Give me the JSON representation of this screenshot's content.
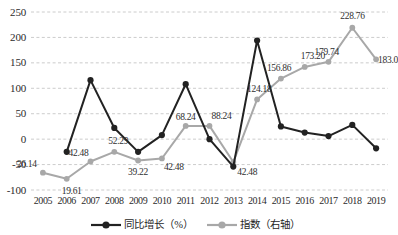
{
  "chart_data": {
    "type": "line",
    "title": "",
    "subtitle": "",
    "xlabel": "",
    "ylabel": "",
    "ylim": [
      -100,
      250
    ],
    "ytick_step": 50,
    "grid": true,
    "grid_style": "dashed",
    "legend_position": "bottom",
    "x": [
      "2005",
      "2006",
      "2007",
      "2008",
      "2009",
      "2010",
      "2011",
      "2012",
      "2013",
      "2014",
      "2015",
      "2016",
      "2017",
      "2018",
      "2019"
    ],
    "categories": [
      "2005",
      "2006",
      "2007",
      "2008",
      "2009",
      "2010",
      "2011",
      "2012",
      "2013",
      "2014",
      "2015",
      "2016",
      "2017",
      "2018",
      "2019"
    ],
    "yticks": [
      "250",
      "200",
      "150",
      "100",
      "50",
      "0",
      "-50",
      "-100"
    ],
    "ytick_values": [
      250,
      200,
      150,
      100,
      50,
      0,
      -50,
      -100
    ],
    "series": [
      {
        "name": "同比增长（%）",
        "color": "#222222",
        "axis": "left",
        "marker": "circle",
        "values": [
          null,
          -25,
          116,
          22,
          -25,
          8,
          108,
          0,
          -54,
          194,
          25,
          13,
          6,
          28,
          -18
        ]
      },
      {
        "name": "指数（右轴）",
        "color": "#a8a8a8",
        "axis": "right",
        "marker": "circle",
        "values": [
          -66,
          -78,
          -44,
          -25,
          -42,
          -38,
          26,
          26,
          -45,
          78,
          119,
          142,
          152,
          219,
          157
        ],
        "data_labels": [
          "26.14",
          "19.61",
          "42.48",
          "52.29",
          "39.22",
          "42.48",
          "68.24",
          "88.24",
          "42.48",
          "124.18",
          "156.86",
          "173.20",
          "179.74",
          "228.76",
          "183.0"
        ],
        "data_label_values": [
          26.14,
          19.61,
          42.48,
          52.29,
          39.22,
          42.48,
          68.24,
          88.24,
          42.48,
          124.18,
          156.86,
          173.2,
          179.74,
          228.76,
          183.0
        ]
      }
    ],
    "annotations": [
      {
        "text": "26.14",
        "x": "2005"
      },
      {
        "text": "19.61",
        "x": "2006"
      },
      {
        "text": "42.48",
        "x": "2007"
      },
      {
        "text": "52.29",
        "x": "2008"
      },
      {
        "text": "39.22",
        "x": "2009"
      },
      {
        "text": "42.48",
        "x": "2010"
      },
      {
        "text": "68.24",
        "x": "2011"
      },
      {
        "text": "88.24",
        "x": "2012"
      },
      {
        "text": "42.48",
        "x": "2013"
      },
      {
        "text": "124.18",
        "x": "2014"
      },
      {
        "text": "156.86",
        "x": "2015"
      },
      {
        "text": "173.20",
        "x": "2016"
      },
      {
        "text": "179.74",
        "x": "2017"
      },
      {
        "text": "228.76",
        "x": "2018"
      },
      {
        "text": "183.0",
        "x": "2019"
      }
    ]
  },
  "legend": {
    "items": [
      {
        "label": "同比增长（%）",
        "color": "#222222"
      },
      {
        "label": "指数（右轴）",
        "color": "#a8a8a8"
      }
    ]
  },
  "colors": {
    "growth_series": "#222222",
    "index_series": "#a8a8a8",
    "gridline": "#bfbfbf",
    "text": "#2b2b2b",
    "background": "#ffffff"
  }
}
